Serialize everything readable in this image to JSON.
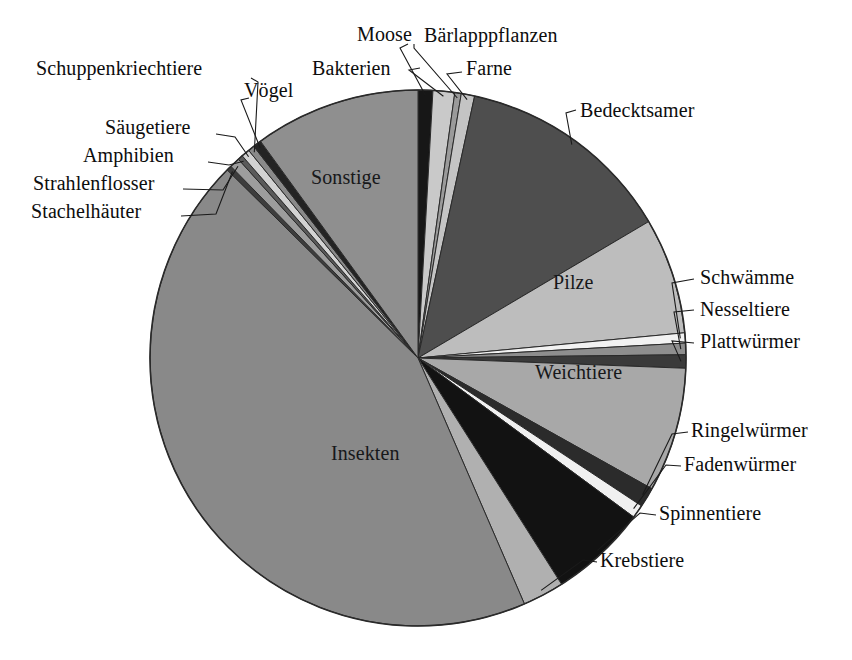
{
  "chart_data": {
    "type": "pie",
    "title": "",
    "subtitle": "",
    "xlabel": "",
    "ylabel": "",
    "legend_position": "none",
    "grid": false,
    "units": "Anteil an der Artenzahl (%)",
    "start_angle_deg": 0,
    "direction": "clockwise",
    "center": {
      "x": 418,
      "y": 358
    },
    "radius": 268,
    "categories": [
      "Moose",
      "Bakterien",
      "Bärlapppflanzen",
      "Farne",
      "Bedecktsamer",
      "Pilze",
      "Schwämme",
      "Nesseltiere",
      "Plattwürmer",
      "Weichtiere",
      "Ringelwürmer",
      "Fadenwürmer",
      "Spinnentiere",
      "Krebstiere",
      "Insekten",
      "Stachelhäuter",
      "Strahlenflosser",
      "Amphibien",
      "Säugetiere",
      "Schuppenkriechtiere",
      "Vögel",
      "Sonstige"
    ],
    "values": [
      0.9,
      1.3,
      0.4,
      0.8,
      13.1,
      7.0,
      0.6,
      0.7,
      0.8,
      7.5,
      1.2,
      0.8,
      5.9,
      2.5,
      43.9,
      0.3,
      0.6,
      0.3,
      0.5,
      0.4,
      0.5,
      10.0
    ],
    "slices": [
      {
        "label": "Moose",
        "value": 0.9,
        "angle_deg": 3.2,
        "color": "#171717",
        "label_mode": "callout",
        "label_side": "top"
      },
      {
        "label": "Bakterien",
        "value": 1.3,
        "angle_deg": 4.7,
        "color": "#c9c9c9",
        "label_mode": "callout",
        "label_side": "top"
      },
      {
        "label": "Bärlapppflanzen",
        "value": 0.4,
        "angle_deg": 1.4,
        "color": "#9a9a9a",
        "label_mode": "callout",
        "label_side": "top"
      },
      {
        "label": "Farne",
        "value": 0.8,
        "angle_deg": 2.9,
        "color": "#c4c4c4",
        "label_mode": "callout",
        "label_side": "top"
      },
      {
        "label": "Bedecktsamer",
        "value": 13.1,
        "angle_deg": 47.2,
        "color": "#4e4e4e",
        "label_mode": "callout",
        "label_side": "right"
      },
      {
        "label": "Pilze",
        "value": 7.0,
        "angle_deg": 25.2,
        "color": "#bdbdbd",
        "label_mode": "inside",
        "label_side": "right"
      },
      {
        "label": "Schwämme",
        "value": 0.6,
        "angle_deg": 2.2,
        "color": "#f2f2f2",
        "label_mode": "callout",
        "label_side": "right"
      },
      {
        "label": "Nesseltiere",
        "value": 0.7,
        "angle_deg": 2.5,
        "color": "#8e8e8e",
        "label_mode": "callout",
        "label_side": "right"
      },
      {
        "label": "Plattwürmer",
        "value": 0.8,
        "angle_deg": 2.9,
        "color": "#3a3a3a",
        "label_mode": "callout",
        "label_side": "right"
      },
      {
        "label": "Weichtiere",
        "value": 7.5,
        "angle_deg": 27.0,
        "color": "#a8a8a8",
        "label_mode": "inside",
        "label_side": "right"
      },
      {
        "label": "Ringelwürmer",
        "value": 1.2,
        "angle_deg": 4.3,
        "color": "#2b2b2b",
        "label_mode": "callout",
        "label_side": "right"
      },
      {
        "label": "Fadenwürmer",
        "value": 0.8,
        "angle_deg": 2.9,
        "color": "#f0f0f0",
        "label_mode": "callout",
        "label_side": "right"
      },
      {
        "label": "Spinnentiere",
        "value": 5.9,
        "angle_deg": 21.2,
        "color": "#121212",
        "label_mode": "callout",
        "label_side": "right"
      },
      {
        "label": "Krebstiere",
        "value": 2.5,
        "angle_deg": 9.0,
        "color": "#b0b0b0",
        "label_mode": "callout",
        "label_side": "right"
      },
      {
        "label": "Insekten",
        "value": 43.9,
        "angle_deg": 158.0,
        "color": "#898989",
        "label_mode": "inside",
        "label_side": "left"
      },
      {
        "label": "Stachelhäuter",
        "value": 0.3,
        "angle_deg": 1.1,
        "color": "#3d3d3d",
        "label_mode": "callout",
        "label_side": "left"
      },
      {
        "label": "Strahlenflosser",
        "value": 0.6,
        "angle_deg": 2.2,
        "color": "#9d9d9d",
        "label_mode": "callout",
        "label_side": "left"
      },
      {
        "label": "Amphibien",
        "value": 0.3,
        "angle_deg": 1.1,
        "color": "#5a5a5a",
        "label_mode": "callout",
        "label_side": "left"
      },
      {
        "label": "Säugetiere",
        "value": 0.5,
        "angle_deg": 1.8,
        "color": "#d2d2d2",
        "label_mode": "callout",
        "label_side": "left"
      },
      {
        "label": "Schuppenkriechtiere",
        "value": 0.4,
        "angle_deg": 1.4,
        "color": "#8a8a8a",
        "label_mode": "callout",
        "label_side": "left"
      },
      {
        "label": "Vögel",
        "value": 0.5,
        "angle_deg": 1.8,
        "color": "#232323",
        "label_mode": "callout",
        "label_side": "left"
      },
      {
        "label": "Sonstige",
        "value": 10.0,
        "angle_deg": 36.0,
        "color": "#8f8f8f",
        "label_mode": "inside",
        "label_side": "top"
      }
    ],
    "annotations": []
  },
  "labels": {
    "moose": "Moose",
    "bakterien": "Bakterien",
    "baerlapppflanzen": "Bärlapppflanzen",
    "farne": "Farne",
    "bedecktsamer": "Bedecktsamer",
    "pilze": "Pilze",
    "schwaemme": "Schwämme",
    "nesseltiere": "Nesseltiere",
    "plattwuermer": "Plattwürmer",
    "weichtiere": "Weichtiere",
    "ringelwuermer": "Ringelwürmer",
    "fadenwuermer": "Fadenwürmer",
    "spinnentiere": "Spinnentiere",
    "krebstiere": "Krebstiere",
    "insekten": "Insekten",
    "stachelhaeuter": "Stachelhäuter",
    "strahlenflosser": "Strahlenflosser",
    "amphibien": "Amphibien",
    "saeugetiere": "Säugetiere",
    "schuppenkriechtiere": "Schuppenkriechtiere",
    "voegel": "Vögel",
    "sonstige": "Sonstige"
  },
  "style": {
    "background": "#ffffff",
    "outline_color": "#2a2a2a",
    "leader_color": "#1a1a1a",
    "text_color": "#101010"
  }
}
